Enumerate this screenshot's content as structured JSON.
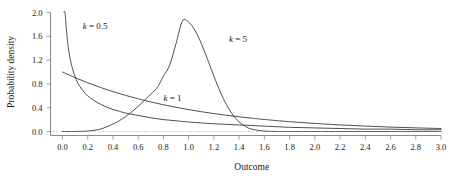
{
  "chart_data": {
    "type": "line",
    "title": "",
    "xlabel": "Outcome",
    "ylabel": "Probability density",
    "xlim": [
      0.0,
      3.0
    ],
    "ylim": [
      0.0,
      2.0
    ],
    "xticks": [
      "0.0",
      "0.2",
      "0.4",
      "0.6",
      "0.8",
      "1.0",
      "1.2",
      "1.4",
      "1.6",
      "1.8",
      "2.0",
      "2.2",
      "2.4",
      "2.6",
      "2.8",
      "3.0"
    ],
    "xtick_values": [
      0.0,
      0.2,
      0.4,
      0.6,
      0.8,
      1.0,
      1.2,
      1.4,
      1.6,
      1.8,
      2.0,
      2.2,
      2.4,
      2.6,
      2.8,
      3.0
    ],
    "yticks": [
      "0.0",
      "0.4",
      "0.8",
      "1.2",
      "1.6",
      "2.0"
    ],
    "ytick_values": [
      0.0,
      0.4,
      0.8,
      1.2,
      1.6,
      2.0
    ],
    "grid": false,
    "zero_line": true,
    "legend_position": "inline-annotations",
    "line_color": "#3b3b3b",
    "axis_color": "#8a8a8a",
    "background": "#ffffff",
    "distribution": "Weibull (scale lambda = 1)",
    "annotations": [
      {
        "text": "k = 0.5",
        "k": 0.5,
        "x": 0.16,
        "y": 1.72
      },
      {
        "text": "k = 5",
        "k": 5,
        "x": 1.32,
        "y": 1.5
      },
      {
        "text": "k = 1",
        "k": 1,
        "x": 0.8,
        "y": 0.52
      }
    ],
    "series": [
      {
        "name": "k = 0.5",
        "k": 0.5,
        "x": [
          0.012,
          0.02,
          0.03,
          0.04,
          0.05,
          0.06,
          0.07,
          0.08,
          0.09,
          0.1,
          0.12,
          0.14,
          0.16,
          0.18,
          0.2,
          0.25,
          0.3,
          0.35,
          0.4,
          0.45,
          0.5,
          0.6,
          0.7,
          0.8,
          0.9,
          1.0,
          1.2,
          1.4,
          1.6,
          1.8,
          2.0,
          2.2,
          2.4,
          2.6,
          2.8,
          3.0
        ],
        "values": [
          2.05,
          2.0,
          1.73,
          1.51,
          1.35,
          1.23,
          1.13,
          1.05,
          0.98,
          0.92,
          0.82,
          0.75,
          0.69,
          0.64,
          0.6,
          0.52,
          0.46,
          0.41,
          0.37,
          0.34,
          0.31,
          0.27,
          0.23,
          0.2,
          0.18,
          0.16,
          0.13,
          0.11,
          0.09,
          0.07,
          0.06,
          0.05,
          0.04,
          0.04,
          0.03,
          0.03
        ]
      },
      {
        "name": "k = 1",
        "k": 1,
        "x": [
          0.0,
          0.1,
          0.2,
          0.3,
          0.4,
          0.5,
          0.6,
          0.7,
          0.8,
          0.9,
          1.0,
          1.1,
          1.2,
          1.3,
          1.4,
          1.5,
          1.6,
          1.8,
          2.0,
          2.2,
          2.4,
          2.6,
          2.8,
          3.0
        ],
        "values": [
          1.0,
          0.905,
          0.819,
          0.741,
          0.67,
          0.607,
          0.549,
          0.497,
          0.449,
          0.407,
          0.368,
          0.333,
          0.301,
          0.273,
          0.247,
          0.223,
          0.202,
          0.165,
          0.135,
          0.111,
          0.091,
          0.074,
          0.061,
          0.05
        ]
      },
      {
        "name": "k = 5",
        "k": 5,
        "x": [
          0.0,
          0.1,
          0.2,
          0.3,
          0.4,
          0.45,
          0.5,
          0.55,
          0.6,
          0.65,
          0.7,
          0.75,
          0.8,
          0.85,
          0.9,
          0.95,
          1.0,
          1.05,
          1.1,
          1.15,
          1.2,
          1.25,
          1.3,
          1.35,
          1.4,
          1.45,
          1.5,
          1.6,
          1.7,
          1.8,
          2.0,
          2.2,
          2.6,
          3.0
        ],
        "values": [
          0.0,
          0.0005,
          0.008,
          0.04,
          0.125,
          0.181,
          0.25,
          0.331,
          0.424,
          0.525,
          0.63,
          0.734,
          0.93,
          1.12,
          1.48,
          1.855,
          1.839,
          1.7,
          1.48,
          1.21,
          0.93,
          0.67,
          0.45,
          0.28,
          0.16,
          0.085,
          0.04,
          0.008,
          0.001,
          0.0001,
          0.0,
          0.0,
          0.0,
          0.0
        ]
      }
    ]
  },
  "axes": {
    "x_title": "Outcome",
    "y_title": "Probability density"
  }
}
